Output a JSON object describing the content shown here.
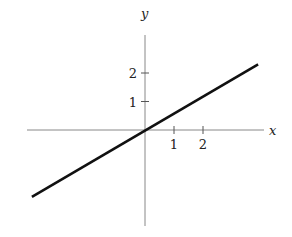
{
  "chart_data": {
    "type": "line",
    "title": "",
    "xlabel": "x",
    "ylabel": "y",
    "x_ticks": [
      "1",
      "2"
    ],
    "y_ticks": [
      "1",
      "2"
    ],
    "xlim": [
      -4,
      4.2
    ],
    "ylim": [
      -3.4,
      3.3
    ],
    "grid": false,
    "legend": null,
    "series": [
      {
        "name": "line",
        "x": [
          -3.9,
          3.9
        ],
        "y": [
          -2.35,
          2.3
        ],
        "slope": 0.6,
        "intercept": 0
      }
    ]
  },
  "layout": {
    "origin": [
      145,
      130
    ],
    "unit_x": 29,
    "unit_y": 28.5,
    "x_axis": [
      27,
      264
    ],
    "y_axis": [
      35,
      226
    ],
    "line_color": "#111111",
    "axis_color": "#888888"
  }
}
